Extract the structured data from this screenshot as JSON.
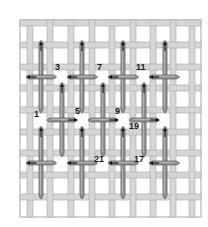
{
  "diagram": {
    "colors": {
      "background": "#ffffff",
      "canvas_thread_fill": "#d6d6d6",
      "canvas_thread_edge": "#a8a8a8",
      "canvas_hole": "#ffffff",
      "stitch_fill": "#8f8f8f",
      "stitch_edge": "#5a5a5a",
      "stitch_highlight": "#c4c4c4",
      "arrow": "#111111",
      "label": "#1a1a1a"
    },
    "canvas": {
      "x": 20,
      "y": 20,
      "width": 181,
      "height": 197,
      "vertical_threads_x": [
        30,
        50,
        71,
        92,
        112,
        133,
        153,
        173,
        192
      ],
      "horizontal_threads_y": [
        23,
        45,
        67,
        88,
        110,
        132,
        153,
        175,
        197
      ],
      "thread_width": 6
    },
    "vertical_stitches": [
      {
        "x": 41,
        "y1": 40,
        "y2": 114,
        "arrow": "up"
      },
      {
        "x": 41,
        "y1": 126,
        "y2": 200,
        "arrow": "up"
      },
      {
        "x": 62,
        "y1": 82,
        "y2": 158,
        "arrow": "up"
      },
      {
        "x": 82,
        "y1": 40,
        "y2": 114,
        "arrow": "up"
      },
      {
        "x": 82,
        "y1": 126,
        "y2": 200,
        "arrow": "up"
      },
      {
        "x": 103,
        "y1": 82,
        "y2": 158,
        "arrow": "up"
      },
      {
        "x": 123,
        "y1": 40,
        "y2": 114,
        "arrow": "up"
      },
      {
        "x": 123,
        "y1": 126,
        "y2": 200,
        "arrow": "up"
      },
      {
        "x": 144,
        "y1": 82,
        "y2": 158,
        "arrow": "up"
      },
      {
        "x": 165,
        "y1": 40,
        "y2": 114,
        "arrow": "up"
      },
      {
        "x": 165,
        "y1": 126,
        "y2": 200,
        "arrow": "up"
      }
    ],
    "horizontal_stitches": [
      {
        "y": 77,
        "x1": 25,
        "x2": 58,
        "arrow": "left"
      },
      {
        "y": 77,
        "x1": 66,
        "x2": 99,
        "arrow": "left"
      },
      {
        "y": 77,
        "x1": 107,
        "x2": 140,
        "arrow": "left"
      },
      {
        "y": 77,
        "x1": 148,
        "x2": 181,
        "arrow": "left"
      },
      {
        "y": 120,
        "x1": 46,
        "x2": 79,
        "arrow": "right"
      },
      {
        "y": 120,
        "x1": 87,
        "x2": 120,
        "arrow": "right"
      },
      {
        "y": 120,
        "x1": 128,
        "x2": 161,
        "arrow": "right"
      },
      {
        "y": 163,
        "x1": 25,
        "x2": 58,
        "arrow": "left"
      },
      {
        "y": 163,
        "x1": 66,
        "x2": 99,
        "arrow": "left"
      },
      {
        "y": 163,
        "x1": 107,
        "x2": 140,
        "arrow": "left"
      },
      {
        "y": 163,
        "x1": 148,
        "x2": 181,
        "arrow": "left"
      }
    ],
    "labels": [
      {
        "text": "3",
        "x": 55,
        "y": 63
      },
      {
        "text": "7",
        "x": 97,
        "y": 63
      },
      {
        "text": "11",
        "x": 136,
        "y": 63
      },
      {
        "text": "1",
        "x": 34,
        "y": 110
      },
      {
        "text": "5",
        "x": 75,
        "y": 107
      },
      {
        "text": "9",
        "x": 115,
        "y": 107
      },
      {
        "text": "19",
        "x": 129,
        "y": 122
      },
      {
        "text": "21",
        "x": 94,
        "y": 155
      },
      {
        "text": "17",
        "x": 134,
        "y": 155
      }
    ]
  }
}
